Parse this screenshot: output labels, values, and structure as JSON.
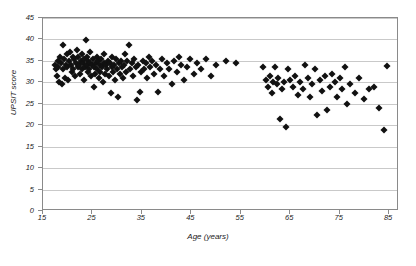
{
  "chart_data": {
    "type": "scatter",
    "title": "",
    "xlabel": "Age (years)",
    "ylabel": "UPSIT score",
    "xlim": [
      15,
      87
    ],
    "ylim": [
      0,
      45
    ],
    "xticks": [
      15,
      25,
      35,
      45,
      55,
      65,
      75,
      85
    ],
    "yticks": [
      0,
      5,
      10,
      15,
      20,
      25,
      30,
      35,
      40,
      45
    ],
    "grid": "horizontal",
    "legend": "none",
    "marker": "filled-diamond",
    "marker_color": "#111111",
    "series": [
      {
        "name": "subjects",
        "points": [
          [
            17.4,
            34.0
          ],
          [
            17.6,
            33.0
          ],
          [
            17.8,
            31.5
          ],
          [
            18.0,
            35.0
          ],
          [
            18.1,
            33.5
          ],
          [
            18.3,
            30.0
          ],
          [
            18.4,
            36.0
          ],
          [
            18.6,
            34.5
          ],
          [
            18.8,
            29.5
          ],
          [
            19.0,
            33.0
          ],
          [
            19.1,
            38.8
          ],
          [
            19.3,
            35.5
          ],
          [
            19.4,
            31.0
          ],
          [
            19.6,
            34.0
          ],
          [
            19.8,
            36.5
          ],
          [
            19.9,
            33.5
          ],
          [
            20.1,
            30.5
          ],
          [
            20.3,
            35.0
          ],
          [
            20.4,
            37.0
          ],
          [
            20.6,
            34.0
          ],
          [
            20.8,
            32.5
          ],
          [
            21.0,
            36.0
          ],
          [
            21.1,
            33.0
          ],
          [
            21.3,
            35.5
          ],
          [
            21.4,
            31.5
          ],
          [
            21.6,
            34.5
          ],
          [
            21.8,
            37.5
          ],
          [
            22.0,
            33.5
          ],
          [
            22.1,
            36.0
          ],
          [
            22.3,
            34.0
          ],
          [
            22.4,
            32.0
          ],
          [
            22.6,
            35.0
          ],
          [
            22.8,
            33.0
          ],
          [
            22.9,
            36.5
          ],
          [
            23.0,
            34.5
          ],
          [
            23.2,
            30.5
          ],
          [
            23.3,
            35.5
          ],
          [
            23.5,
            33.5
          ],
          [
            23.6,
            39.8
          ],
          [
            23.8,
            34.0
          ],
          [
            23.9,
            36.0
          ],
          [
            24.0,
            32.5
          ],
          [
            24.2,
            35.0
          ],
          [
            24.3,
            33.0
          ],
          [
            24.5,
            34.5
          ],
          [
            24.6,
            37.0
          ],
          [
            24.8,
            31.5
          ],
          [
            25.0,
            34.0
          ],
          [
            25.1,
            35.5
          ],
          [
            25.3,
            33.5
          ],
          [
            25.4,
            29.0
          ],
          [
            25.6,
            32.0
          ],
          [
            25.8,
            34.5
          ],
          [
            25.9,
            36.0
          ],
          [
            26.0,
            33.0
          ],
          [
            26.2,
            35.0
          ],
          [
            26.3,
            31.0
          ],
          [
            26.5,
            34.0
          ],
          [
            26.6,
            32.5
          ],
          [
            26.8,
            35.5
          ],
          [
            27.0,
            33.5
          ],
          [
            27.1,
            30.0
          ],
          [
            27.3,
            34.5
          ],
          [
            27.4,
            36.5
          ],
          [
            27.6,
            32.0
          ],
          [
            27.8,
            34.0
          ],
          [
            28.0,
            33.0
          ],
          [
            28.2,
            35.0
          ],
          [
            28.4,
            31.5
          ],
          [
            28.5,
            34.5
          ],
          [
            28.7,
            27.5
          ],
          [
            28.9,
            33.5
          ],
          [
            29.0,
            36.0
          ],
          [
            29.2,
            32.5
          ],
          [
            29.4,
            34.0
          ],
          [
            29.6,
            30.5
          ],
          [
            29.8,
            35.5
          ],
          [
            30.0,
            33.0
          ],
          [
            30.2,
            26.5
          ],
          [
            30.4,
            34.5
          ],
          [
            30.6,
            32.0
          ],
          [
            30.8,
            35.0
          ],
          [
            31.0,
            33.5
          ],
          [
            31.2,
            31.0
          ],
          [
            31.4,
            34.0
          ],
          [
            31.6,
            36.5
          ],
          [
            31.8,
            32.5
          ],
          [
            32.0,
            35.0
          ],
          [
            32.3,
            38.8
          ],
          [
            32.6,
            33.0
          ],
          [
            32.9,
            34.5
          ],
          [
            33.2,
            31.5
          ],
          [
            33.5,
            35.5
          ],
          [
            33.8,
            33.5
          ],
          [
            34.0,
            25.8
          ],
          [
            34.3,
            34.0
          ],
          [
            34.6,
            27.8
          ],
          [
            34.9,
            32.5
          ],
          [
            35.2,
            35.0
          ],
          [
            35.5,
            33.0
          ],
          [
            35.8,
            34.5
          ],
          [
            36.1,
            31.0
          ],
          [
            36.4,
            36.0
          ],
          [
            36.7,
            33.5
          ],
          [
            37.0,
            35.0
          ],
          [
            37.4,
            32.0
          ],
          [
            37.8,
            34.0
          ],
          [
            38.2,
            27.8
          ],
          [
            38.6,
            33.0
          ],
          [
            39.0,
            35.5
          ],
          [
            39.5,
            31.5
          ],
          [
            40.0,
            34.5
          ],
          [
            40.5,
            33.0
          ],
          [
            41.0,
            29.5
          ],
          [
            41.5,
            35.0
          ],
          [
            42.0,
            32.5
          ],
          [
            42.5,
            36.0
          ],
          [
            43.0,
            34.0
          ],
          [
            43.6,
            30.5
          ],
          [
            44.2,
            33.5
          ],
          [
            44.8,
            35.5
          ],
          [
            45.5,
            32.0
          ],
          [
            46.2,
            34.5
          ],
          [
            47.0,
            33.0
          ],
          [
            48.0,
            35.5
          ],
          [
            49.0,
            31.5
          ],
          [
            50.0,
            34.0
          ],
          [
            52.0,
            35.0
          ],
          [
            54.0,
            34.5
          ],
          [
            59.5,
            33.5
          ],
          [
            60.0,
            30.5
          ],
          [
            60.5,
            29.0
          ],
          [
            61.0,
            31.5
          ],
          [
            61.3,
            27.5
          ],
          [
            61.6,
            30.0
          ],
          [
            62.0,
            33.5
          ],
          [
            62.3,
            29.5
          ],
          [
            62.6,
            31.0
          ],
          [
            63.0,
            21.5
          ],
          [
            63.4,
            28.5
          ],
          [
            63.8,
            30.0
          ],
          [
            64.2,
            19.5
          ],
          [
            64.6,
            33.0
          ],
          [
            65.0,
            30.5
          ],
          [
            65.5,
            29.0
          ],
          [
            66.0,
            31.5
          ],
          [
            66.5,
            27.0
          ],
          [
            67.0,
            30.0
          ],
          [
            67.5,
            28.5
          ],
          [
            68.0,
            34.0
          ],
          [
            68.5,
            31.0
          ],
          [
            69.0,
            26.5
          ],
          [
            69.5,
            29.5
          ],
          [
            70.0,
            33.0
          ],
          [
            70.5,
            22.5
          ],
          [
            71.0,
            30.5
          ],
          [
            71.5,
            28.0
          ],
          [
            72.0,
            31.5
          ],
          [
            72.5,
            23.5
          ],
          [
            73.0,
            29.0
          ],
          [
            73.5,
            32.0
          ],
          [
            74.0,
            30.0
          ],
          [
            74.5,
            26.5
          ],
          [
            75.0,
            31.0
          ],
          [
            75.5,
            28.5
          ],
          [
            76.0,
            33.5
          ],
          [
            76.5,
            25.0
          ],
          [
            77.0,
            29.5
          ],
          [
            78.0,
            27.5
          ],
          [
            79.0,
            31.0
          ],
          [
            80.0,
            26.0
          ],
          [
            81.0,
            28.5
          ],
          [
            82.0,
            29.0
          ],
          [
            83.0,
            24.0
          ],
          [
            84.0,
            19.0
          ],
          [
            84.5,
            33.8
          ]
        ]
      }
    ]
  }
}
